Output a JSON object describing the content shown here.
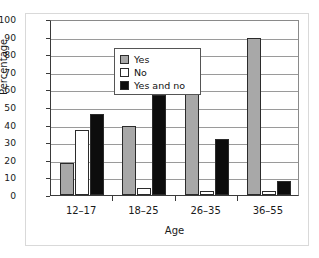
{
  "chart_data": {
    "type": "bar",
    "title": "",
    "xlabel": "Age",
    "ylabel": "Percentage",
    "categories": [
      "12–17",
      "18–25",
      "26–35",
      "36–55"
    ],
    "series": [
      {
        "name": "Yes",
        "values": [
          18,
          39,
          66,
          89
        ],
        "color": "#a8a8a8"
      },
      {
        "name": "No",
        "values": [
          37,
          4,
          2,
          2
        ],
        "color": "#ffffff"
      },
      {
        "name": "Yes and no",
        "values": [
          46,
          57,
          32,
          8
        ],
        "color": "#0d0d0d"
      }
    ],
    "ylim": [
      0,
      100
    ],
    "ytick_labels": [
      "0",
      "10",
      "20",
      "30",
      "40",
      "50",
      "60",
      "70",
      "80",
      "90",
      "100"
    ],
    "ytick_values": [
      0,
      10,
      20,
      30,
      40,
      50,
      60,
      70,
      80,
      90,
      100
    ],
    "grid": true,
    "legend_position": "upper-left",
    "legend_entries": [
      "Yes",
      "No",
      "Yes and no"
    ]
  }
}
